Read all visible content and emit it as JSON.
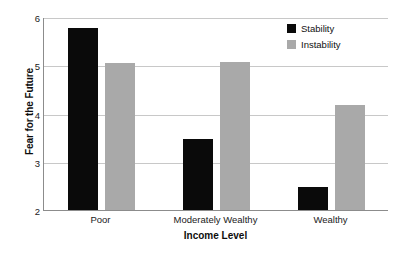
{
  "chart_data": {
    "type": "bar",
    "title": "",
    "subtitle": "",
    "xlabel": "Income Level",
    "ylabel": "Fear for the Future",
    "categories": [
      "Poor",
      "Moderately Wealthy",
      "Wealthy"
    ],
    "series": [
      {
        "name": "Stability",
        "color": "#0a0a0a",
        "values": [
          5.78,
          3.48,
          2.48
        ]
      },
      {
        "name": "Instability",
        "color": "#a9a9a9",
        "values": [
          5.05,
          5.07,
          4.17
        ]
      }
    ],
    "ylim": [
      2,
      6
    ],
    "yticks": [
      2,
      3,
      4,
      5,
      6
    ],
    "ytick_labels": [
      "2",
      "3",
      "4",
      "5",
      "6"
    ],
    "grid": "horizontal",
    "legend_position": "top-right",
    "annotations": []
  },
  "axes": {
    "y_title": "Fear for the Future",
    "x_title": "Income Level"
  },
  "legend": {
    "entries": [
      {
        "label": "Stability",
        "swatch": "#0a0a0a"
      },
      {
        "label": "Instability",
        "swatch": "#a9a9a9"
      }
    ]
  }
}
